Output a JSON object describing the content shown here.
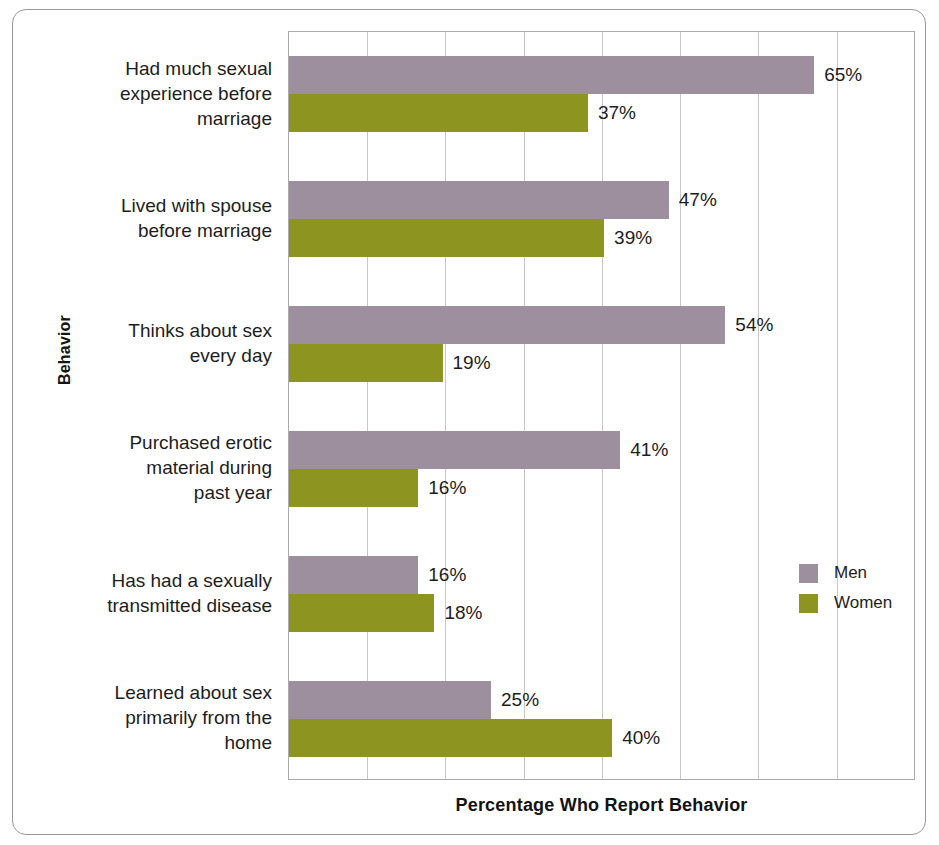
{
  "chart_data": {
    "type": "bar",
    "orientation": "horizontal",
    "title": "",
    "xlabel": "Percentage Who Report Behavior",
    "ylabel": "Behavior",
    "xlim": [
      0,
      77.5
    ],
    "grid": true,
    "gridline_interval_percent": 9.68,
    "gridline_count": 7,
    "legend_position": "right-middle",
    "categories": [
      "Had much sexual experience before marriage",
      "Lived with spouse before marriage",
      "Thinks about sex every day",
      "Purchased erotic material during past year",
      "Has had a sexually transmitted disease",
      "Learned about sex primarily from the home"
    ],
    "series": [
      {
        "name": "Men",
        "color": "#9e8f9f",
        "values": [
          65,
          47,
          54,
          41,
          16,
          25
        ]
      },
      {
        "name": "Women",
        "color": "#8d9520",
        "values": [
          37,
          39,
          19,
          16,
          18,
          40
        ]
      }
    ],
    "value_labels": [
      [
        "65%",
        "37%"
      ],
      [
        "47%",
        "39%"
      ],
      [
        "54%",
        "19%"
      ],
      [
        "41%",
        "16%"
      ],
      [
        "16%",
        "18%"
      ],
      [
        "25%",
        "40%"
      ]
    ]
  },
  "axes": {
    "x_title": "Percentage Who Report Behavior",
    "y_title": "Behavior"
  },
  "categories": [
    {
      "lines": [
        "Had much sexual",
        "experience before",
        "marriage"
      ]
    },
    {
      "lines": [
        "Lived with spouse",
        "before marriage"
      ]
    },
    {
      "lines": [
        "Thinks about sex",
        "every day"
      ]
    },
    {
      "lines": [
        "Purchased erotic",
        "material during",
        "past year"
      ]
    },
    {
      "lines": [
        "Has had a sexually",
        "transmitted disease"
      ]
    },
    {
      "lines": [
        "Learned about sex",
        "primarily from the",
        "home"
      ]
    }
  ],
  "category_labels_flat": [
    "Had much sexual experience before marriage",
    "Lived with spouse before marriage",
    "Thinks about sex every day",
    "Purchased erotic material during past year",
    "Has had a sexually transmitted disease",
    "Learned about sex primarily from the home"
  ],
  "legend": {
    "items": [
      {
        "label": "Men",
        "color": "#9e8f9f"
      },
      {
        "label": "Women",
        "color": "#8d9520"
      }
    ]
  },
  "colors": {
    "men": "#9e8f9f",
    "women": "#8d9520",
    "gridline": "#c6c6cb",
    "plot_border": "#a9a9ae",
    "frame_border": "#9b95a0",
    "text": "#1d1d1d",
    "background": "#ffffff"
  }
}
